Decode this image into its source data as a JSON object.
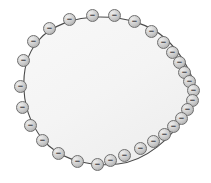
{
  "figure": {
    "canvas": {
      "width": 211,
      "height": 183,
      "background": "#ffffff"
    },
    "body": {
      "name": "conductor-body",
      "fill": "#f4f4f4",
      "stroke": "#4a4a4a",
      "stroke_width": 1.1,
      "path": "M 196 88 C 190 70 180 52 166 39 C 150 24 125 17 100 17 C 74 17 50 26 38 41 C 26 55 23 73 24 90 C 25 110 33 131 49 146 C 66 161 92 167 118 164 C 146 161 172 138 186 114 C 192 104 196 95 196 88 Z"
    },
    "charge_symbol": "−",
    "charge_style": {
      "diameter": 13,
      "fill_light": "#ececec",
      "fill_mid": "#c4c4c4",
      "fill_dark": "#8f8f8f",
      "stroke": "#6f6f6f",
      "sign_color": "#3a3a3a"
    },
    "charge_count": 30,
    "charges": [
      {
        "label": "−",
        "x": 86,
        "y": 9
      },
      {
        "label": "−",
        "x": 108,
        "y": 9
      },
      {
        "label": "−",
        "x": 63,
        "y": 13
      },
      {
        "label": "−",
        "x": 128,
        "y": 15
      },
      {
        "label": "−",
        "x": 43,
        "y": 22
      },
      {
        "label": "−",
        "x": 145,
        "y": 25
      },
      {
        "label": "−",
        "x": 27,
        "y": 35
      },
      {
        "label": "−",
        "x": 157,
        "y": 36
      },
      {
        "label": "−",
        "x": 166,
        "y": 46
      },
      {
        "label": "−",
        "x": 17,
        "y": 54
      },
      {
        "label": "−",
        "x": 173,
        "y": 56
      },
      {
        "label": "−",
        "x": 178,
        "y": 66
      },
      {
        "label": "−",
        "x": 14,
        "y": 80
      },
      {
        "label": "−",
        "x": 183,
        "y": 75
      },
      {
        "label": "−",
        "x": 187,
        "y": 84
      },
      {
        "label": "−",
        "x": 186,
        "y": 94
      },
      {
        "label": "−",
        "x": 16,
        "y": 101
      },
      {
        "label": "−",
        "x": 181,
        "y": 103
      },
      {
        "label": "−",
        "x": 175,
        "y": 112
      },
      {
        "label": "−",
        "x": 24,
        "y": 119
      },
      {
        "label": "−",
        "x": 167,
        "y": 120
      },
      {
        "label": "−",
        "x": 158,
        "y": 128
      },
      {
        "label": "−",
        "x": 36,
        "y": 134
      },
      {
        "label": "−",
        "x": 147,
        "y": 135
      },
      {
        "label": "−",
        "x": 134,
        "y": 142
      },
      {
        "label": "−",
        "x": 52,
        "y": 147
      },
      {
        "label": "−",
        "x": 118,
        "y": 149
      },
      {
        "label": "−",
        "x": 71,
        "y": 155
      },
      {
        "label": "−",
        "x": 91,
        "y": 158
      },
      {
        "label": "−",
        "x": 104,
        "y": 154
      }
    ]
  }
}
